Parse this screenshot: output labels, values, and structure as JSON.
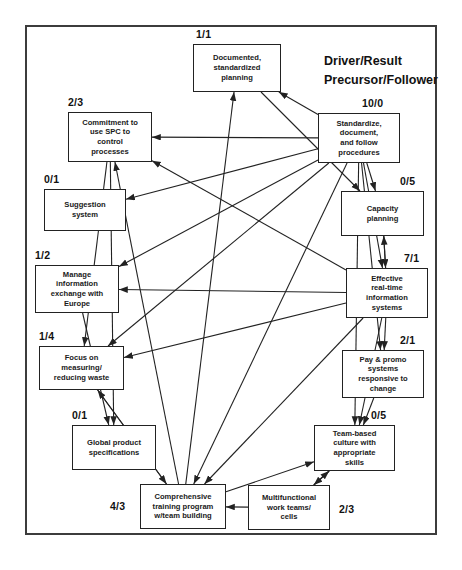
{
  "diagram": {
    "title_block": "Driver/Result\nPrecursor/Follower",
    "legend_line1": "Driver/Result",
    "legend_line2": "Precursor/Follower",
    "nodes": [
      {
        "id": "documented",
        "label": "Documented,\nstandardized\nplanning",
        "ratio": "1/1",
        "x": 193,
        "y": 44,
        "w": 88,
        "h": 48,
        "ratio_x": 196,
        "ratio_y": 28,
        "ratio_align": "left"
      },
      {
        "id": "commitment",
        "label": "Commitment to\nuse SPC to\ncontrol\nprocesses",
        "ratio": "2/3",
        "x": 68,
        "y": 112,
        "w": 84,
        "h": 50,
        "ratio_x": 68,
        "ratio_y": 96,
        "ratio_align": "left"
      },
      {
        "id": "standardize",
        "label": "Standardize,\ndocument,\nand follow\nprocedures",
        "ratio": "10/0",
        "x": 318,
        "y": 113,
        "w": 82,
        "h": 50,
        "ratio_x": 362,
        "ratio_y": 97,
        "ratio_align": "left"
      },
      {
        "id": "suggestion",
        "label": "Suggestion\nsystem",
        "ratio": "0/1",
        "x": 44,
        "y": 189,
        "w": 82,
        "h": 42,
        "ratio_x": 44,
        "ratio_y": 173,
        "ratio_align": "left"
      },
      {
        "id": "capacity",
        "label": "Capacity\nplanning",
        "ratio": "0/5",
        "x": 341,
        "y": 191,
        "w": 83,
        "h": 45,
        "ratio_x": 400,
        "ratio_y": 175,
        "ratio_align": "left"
      },
      {
        "id": "manage_info",
        "label": "Manage\ninformation\nexchange with\nEurope",
        "ratio": "1/2",
        "x": 35,
        "y": 265,
        "w": 84,
        "h": 48,
        "ratio_x": 35,
        "ratio_y": 249,
        "ratio_align": "left"
      },
      {
        "id": "effective_it",
        "label": "Effective\nreal-time\ninformation\nsystems",
        "ratio": "7/1",
        "x": 346,
        "y": 268,
        "w": 82,
        "h": 50,
        "ratio_x": 404,
        "ratio_y": 252,
        "ratio_align": "left"
      },
      {
        "id": "focus_waste",
        "label": "Focus on\nmeasuring/\nreducing waste",
        "ratio": "1/4",
        "x": 39,
        "y": 346,
        "w": 85,
        "h": 44,
        "ratio_x": 39,
        "ratio_y": 330,
        "ratio_align": "left"
      },
      {
        "id": "pay_promo",
        "label": "Pay & promo\nsystems\nresponsive to\nchange",
        "ratio": "2/1",
        "x": 342,
        "y": 350,
        "w": 82,
        "h": 48,
        "ratio_x": 400,
        "ratio_y": 334,
        "ratio_align": "left"
      },
      {
        "id": "global_spec",
        "label": "Global product\nspecifications",
        "ratio": "0/1",
        "x": 72,
        "y": 425,
        "w": 84,
        "h": 45,
        "ratio_x": 72,
        "ratio_y": 409,
        "ratio_align": "left"
      },
      {
        "id": "team_culture",
        "label": "Team-based\nculture with\nappropriate\nskills",
        "ratio": "0/5",
        "x": 314,
        "y": 425,
        "w": 81,
        "h": 46,
        "ratio_x": 371,
        "ratio_y": 409,
        "ratio_align": "left"
      },
      {
        "id": "training",
        "label": "Comprehensive\ntraining program\nw/team building",
        "ratio": "4/3",
        "x": 140,
        "y": 484,
        "w": 86,
        "h": 45,
        "ratio_x": 110,
        "ratio_y": 500,
        "ratio_align": "left"
      },
      {
        "id": "multifunc",
        "label": "Multifunctional\nwork teams/\ncells",
        "ratio": "2/3",
        "x": 248,
        "y": 485,
        "w": 82,
        "h": 45,
        "ratio_x": 339,
        "ratio_y": 503,
        "ratio_align": "left"
      }
    ],
    "edges": [
      {
        "from": "standardize",
        "to": "commitment"
      },
      {
        "from": "standardize",
        "to": "documented"
      },
      {
        "from": "standardize",
        "to": "suggestion"
      },
      {
        "from": "standardize",
        "to": "manage_info"
      },
      {
        "from": "standardize",
        "to": "focus_waste"
      },
      {
        "from": "standardize",
        "to": "capacity"
      },
      {
        "from": "standardize",
        "to": "effective_it"
      },
      {
        "from": "standardize",
        "to": "pay_promo"
      },
      {
        "from": "standardize",
        "to": "team_culture"
      },
      {
        "from": "standardize",
        "to": "training"
      },
      {
        "from": "effective_it",
        "to": "commitment"
      },
      {
        "from": "effective_it",
        "to": "manage_info"
      },
      {
        "from": "effective_it",
        "to": "focus_waste"
      },
      {
        "from": "effective_it",
        "to": "capacity"
      },
      {
        "from": "effective_it",
        "to": "training"
      },
      {
        "from": "effective_it",
        "to": "team_culture"
      },
      {
        "from": "effective_it",
        "to": "pay_promo"
      },
      {
        "from": "training",
        "to": "commitment"
      },
      {
        "from": "training",
        "to": "focus_waste"
      },
      {
        "from": "training",
        "to": "documented"
      },
      {
        "from": "training",
        "to": "team_culture"
      },
      {
        "from": "multifunc",
        "to": "training"
      },
      {
        "from": "multifunc",
        "to": "team_culture"
      },
      {
        "from": "commitment",
        "to": "focus_waste"
      },
      {
        "from": "commitment",
        "to": "global_spec"
      },
      {
        "from": "documented",
        "to": "capacity"
      },
      {
        "from": "pay_promo",
        "to": "team_culture"
      },
      {
        "from": "manage_info",
        "to": "global_spec"
      },
      {
        "from": "focus_waste",
        "to": "training"
      },
      {
        "from": "team_culture",
        "to": "multifunc"
      },
      {
        "from": "capacity",
        "to": "effective_it"
      }
    ],
    "colors": {
      "line": "#222222",
      "border": "#3c3c3c",
      "text": "#111111"
    }
  }
}
